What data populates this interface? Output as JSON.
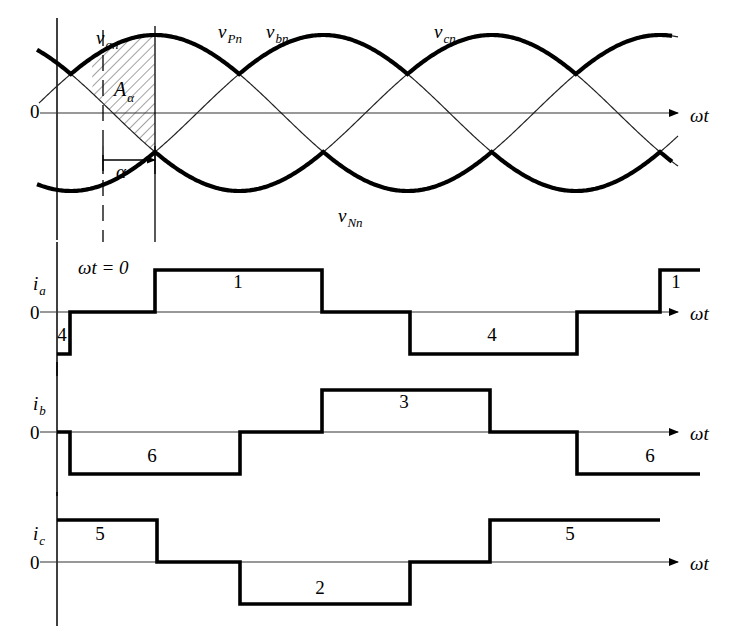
{
  "figure": {
    "title_text": "",
    "colors": {
      "ink": "#000000",
      "thin": "#3a3a3a",
      "hatch": "#555555",
      "background": "#ffffff"
    },
    "axis_label": "ωt",
    "zero_label": "0"
  },
  "voltage_panel": {
    "name": "three-phase-voltage-waveforms",
    "labels": {
      "v_an": "v",
      "v_an_sub": "an",
      "v_Pn": "v",
      "v_Pn_sub": "Pn",
      "v_bn": "v",
      "v_bn_sub": "bn",
      "v_cn": "v",
      "v_cn_sub": "cn",
      "v_Nn": "v",
      "v_Nn_sub": "Nn",
      "area": "A",
      "area_sub": "α",
      "alpha": "α",
      "zero": "0",
      "omega_t": "ωt"
    },
    "label_positions": {
      "v_an": [
        96,
        44
      ],
      "v_Pn": [
        218,
        38
      ],
      "v_bn": [
        266,
        38
      ],
      "v_cn": [
        434,
        38
      ],
      "v_Nn": [
        338,
        222
      ],
      "area": [
        114,
        96
      ],
      "alpha": [
        116,
        178
      ],
      "zero": [
        30,
        118
      ],
      "omega_t": [
        690,
        122
      ]
    },
    "axis": {
      "x0": 57,
      "x1": 660,
      "y_zero": 113,
      "amplitude": 78,
      "top": 22,
      "bottom": 212
    },
    "alpha_degrees": 45,
    "alpha_arrow": {
      "from_x": 103,
      "to_x": 155,
      "y": 160
    },
    "dashed_verticals": [
      103
    ],
    "solid_verticals": [
      57,
      155
    ],
    "phase_sines": [
      {
        "name": "v_an",
        "phase_deg": 90,
        "thick": false
      },
      {
        "name": "v_bn",
        "phase_deg": -30,
        "thick": false
      },
      {
        "name": "v_cn",
        "phase_deg": 210,
        "thick": false
      }
    ],
    "hatched_area": {
      "name": "A_alpha",
      "start_deg": 0,
      "end_deg": 45,
      "label": "Aα"
    }
  },
  "current_panels": [
    {
      "name": "ia",
      "label": "i",
      "label_sub": "a",
      "extra_label": "ωt = 0",
      "axis_label": "ωt",
      "zero_label": "0",
      "y_zero": 312,
      "height": 42,
      "x0": 57,
      "x1": 660,
      "segments": [
        {
          "from": 57,
          "to": 70,
          "level": -1,
          "device": "4"
        },
        {
          "from": 70,
          "to": 155,
          "level": 0,
          "device": ""
        },
        {
          "from": 155,
          "to": 322,
          "level": 1,
          "device": "1"
        },
        {
          "from": 322,
          "to": 410,
          "level": 0,
          "device": ""
        },
        {
          "from": 410,
          "to": 577,
          "level": -1,
          "device": "4"
        },
        {
          "from": 577,
          "to": 660,
          "level": 0,
          "device": ""
        },
        {
          "from": 660,
          "to": 700,
          "level": 1,
          "device": "1"
        }
      ],
      "device_labels": [
        {
          "text": "4",
          "x": 62,
          "y": 341
        },
        {
          "text": "1",
          "x": 238,
          "y": 288
        },
        {
          "text": "4",
          "x": 492,
          "y": 341
        },
        {
          "text": "1",
          "x": 676,
          "y": 288
        }
      ]
    },
    {
      "name": "ib",
      "label": "i",
      "label_sub": "b",
      "extra_label": "",
      "axis_label": "ωt",
      "zero_label": "0",
      "y_zero": 432,
      "height": 42,
      "x0": 57,
      "x1": 660,
      "segments": [
        {
          "from": 57,
          "to": 70,
          "level": 0,
          "device": ""
        },
        {
          "from": 70,
          "to": 240,
          "level": -1,
          "device": "6"
        },
        {
          "from": 240,
          "to": 322,
          "level": 0,
          "device": ""
        },
        {
          "from": 322,
          "to": 490,
          "level": 1,
          "device": "3"
        },
        {
          "from": 490,
          "to": 577,
          "level": 0,
          "device": ""
        },
        {
          "from": 577,
          "to": 700,
          "level": -1,
          "device": "6"
        }
      ],
      "device_labels": [
        {
          "text": "6",
          "x": 152,
          "y": 462
        },
        {
          "text": "3",
          "x": 404,
          "y": 408
        },
        {
          "text": "6",
          "x": 650,
          "y": 462
        }
      ]
    },
    {
      "name": "ic",
      "label": "i",
      "label_sub": "c",
      "extra_label": "",
      "axis_label": "ωt",
      "zero_label": "0",
      "y_zero": 562,
      "height": 42,
      "x0": 57,
      "x1": 660,
      "segments": [
        {
          "from": 57,
          "to": 157,
          "level": 1,
          "device": "5"
        },
        {
          "from": 157,
          "to": 240,
          "level": 0,
          "device": ""
        },
        {
          "from": 240,
          "to": 410,
          "level": -1,
          "device": "2"
        },
        {
          "from": 410,
          "to": 490,
          "level": 0,
          "device": ""
        },
        {
          "from": 490,
          "to": 660,
          "level": 1,
          "device": "5"
        }
      ],
      "device_labels": [
        {
          "text": "5",
          "x": 100,
          "y": 540
        },
        {
          "text": "2",
          "x": 320,
          "y": 594
        },
        {
          "text": "5",
          "x": 570,
          "y": 540
        }
      ]
    }
  ],
  "chart_data": {
    "type": "line",
    "xlabel": "ωt",
    "ylabel": "",
    "grid": false,
    "legend": [
      "v_an",
      "v_bn",
      "v_cn",
      "v_Pn",
      "v_Nn",
      "i_a",
      "i_b",
      "i_c"
    ],
    "firing_angle_alpha_deg": 45,
    "series": [
      {
        "name": "v_an",
        "type": "sine",
        "phase_deg": 90,
        "amplitude": 1
      },
      {
        "name": "v_bn",
        "type": "sine",
        "phase_deg": -30,
        "amplitude": 1
      },
      {
        "name": "v_cn",
        "type": "sine",
        "phase_deg": 210,
        "amplitude": 1
      },
      {
        "name": "v_Pn",
        "type": "max-envelope-delayed",
        "delay_deg": 45
      },
      {
        "name": "v_Nn",
        "type": "min-envelope-delayed",
        "delay_deg": 45
      },
      {
        "name": "i_a",
        "type": "quasi-square",
        "values": [
          -1,
          0,
          1,
          0,
          -1,
          0,
          1
        ],
        "devices": [
          "4",
          "",
          "1",
          "",
          "4",
          "",
          "1"
        ]
      },
      {
        "name": "i_b",
        "type": "quasi-square",
        "values": [
          0,
          -1,
          0,
          1,
          0,
          -1
        ],
        "devices": [
          "",
          "6",
          "",
          "3",
          "",
          "6"
        ]
      },
      {
        "name": "i_c",
        "type": "quasi-square",
        "values": [
          1,
          0,
          -1,
          0,
          1
        ],
        "devices": [
          "5",
          "",
          "2",
          "",
          "5"
        ]
      }
    ],
    "annotations": [
      {
        "text": "Aα",
        "meaning": "shaded area between v_an and v_Pn over firing delay"
      },
      {
        "text": "α",
        "meaning": "firing delay angle arrow"
      },
      {
        "text": "ωt = 0",
        "meaning": "time origin reference on i_a axis"
      }
    ]
  }
}
